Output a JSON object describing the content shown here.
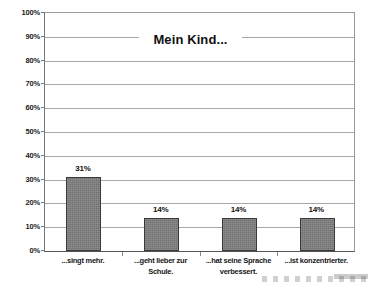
{
  "chart_data": {
    "type": "bar",
    "title": "Mein Kind...",
    "xlabel": "",
    "ylabel": "",
    "ylim": [
      0,
      100
    ],
    "grid": true,
    "legend": "none",
    "categories": [
      "...singt mehr.",
      "...geht lieber zur Schule.",
      "...hat seine Sprache verbessert.",
      "...ist konzentrierter."
    ],
    "category_lines": [
      [
        "...singt mehr."
      ],
      [
        "...geht lieber zur",
        "Schule."
      ],
      [
        "...hat seine Sprache",
        "verbessert."
      ],
      [
        "...ist konzentrierter."
      ]
    ],
    "values": [
      31,
      14,
      14,
      14
    ],
    "data_labels": [
      "31%",
      "14%",
      "14%",
      "14%"
    ],
    "y_ticks": [
      0,
      10,
      20,
      30,
      40,
      50,
      60,
      70,
      80,
      90,
      100
    ],
    "y_tick_labels": [
      "0%",
      "10%",
      "20%",
      "30%",
      "40%",
      "50%",
      "60%",
      "70%",
      "80%",
      "90%",
      "100%"
    ],
    "colors": {
      "bar_fill": "#7d7d7d",
      "bar_border": "#3a3a3a",
      "gridline": "#a8a8a8",
      "axis": "#555555",
      "text": "#111111",
      "background": "#ffffff"
    }
  }
}
